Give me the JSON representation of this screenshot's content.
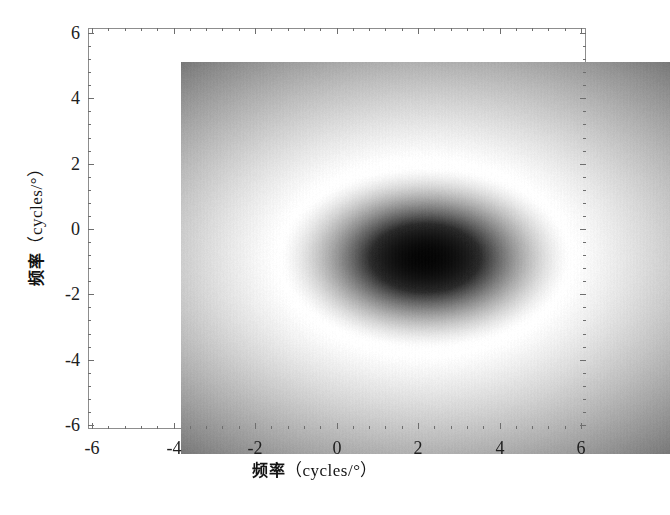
{
  "figure": {
    "title": "",
    "background_color": "#ffffff"
  },
  "axes": {
    "x": {
      "label_cjk": "频率",
      "label_unit": "（cycles/°）",
      "label_full": "频率（cycles/°）",
      "ticks": [
        "-6",
        "-4",
        "-2",
        "0",
        "2",
        "4",
        "6"
      ],
      "tick_values": [
        -6,
        -4,
        -2,
        0,
        2,
        4,
        6
      ],
      "range": [
        -6,
        6
      ],
      "minor_ticks_per_interval": 4
    },
    "y": {
      "label_cjk": "频率",
      "label_unit": "（cycles/°）",
      "label_full": "频率（cycles/°）",
      "ticks": [
        "-6",
        "-4",
        "-2",
        "0",
        "2",
        "4",
        "6"
      ],
      "tick_values": [
        -6,
        -4,
        -2,
        0,
        2,
        4,
        6
      ],
      "range": [
        -6,
        6
      ],
      "minor_ticks_per_interval": 4
    }
  },
  "chart_data": {
    "type": "heatmap",
    "title": "",
    "xlabel": "频率（cycles/°）",
    "ylabel": "频率（cycles/°）",
    "xlim": [
      -6,
      6
    ],
    "ylim": [
      -6,
      6
    ],
    "xticks": [
      -6,
      -4,
      -2,
      0,
      2,
      4,
      6
    ],
    "yticks": [
      -6,
      -4,
      -2,
      0,
      2,
      4,
      6
    ],
    "grid": false,
    "legend": "none",
    "colormap": "gray",
    "colormap_reversed": true,
    "center": [
      0.0,
      0.0
    ],
    "core": {
      "shape": "ellipse",
      "semi_axis_x": 1.35,
      "semi_axis_y": 1.05,
      "min_value": 0.02,
      "min_gray_hex": "#0a0a0a"
    },
    "bright_ring": {
      "radius_x": 3.6,
      "radius_y": 3.0,
      "max_value": 1.0,
      "max_gray_hex": "#ffffff"
    },
    "outer_falloff": {
      "corner_value": 0.47,
      "corner_gray_hex": "#787878",
      "edge_midpoint_value": 0.81,
      "edge_midpoint_gray_hex": "#cfcfcf"
    },
    "sample_points": [
      {
        "x": 0.0,
        "y": 0.0,
        "gray": 0.03
      },
      {
        "x": 0.8,
        "y": 0.0,
        "gray": 0.06
      },
      {
        "x": 0.0,
        "y": 0.7,
        "gray": 0.06
      },
      {
        "x": 1.4,
        "y": 0.0,
        "gray": 0.16
      },
      {
        "x": 0.0,
        "y": 1.1,
        "gray": 0.16
      },
      {
        "x": 2.0,
        "y": 0.0,
        "gray": 0.42
      },
      {
        "x": 0.0,
        "y": 1.6,
        "gray": 0.42
      },
      {
        "x": 2.6,
        "y": 0.0,
        "gray": 0.72
      },
      {
        "x": 0.0,
        "y": 2.1,
        "gray": 0.72
      },
      {
        "x": 3.4,
        "y": 0.0,
        "gray": 0.97
      },
      {
        "x": 0.0,
        "y": 2.8,
        "gray": 0.97
      },
      {
        "x": 4.2,
        "y": 0.0,
        "gray": 1.0
      },
      {
        "x": 0.0,
        "y": 3.5,
        "gray": 1.0
      },
      {
        "x": 6.0,
        "y": 0.0,
        "gray": 0.82
      },
      {
        "x": 0.0,
        "y": 6.0,
        "gray": 0.81
      },
      {
        "x": 6.0,
        "y": 6.0,
        "gray": 0.47
      },
      {
        "x": -6.0,
        "y": 6.0,
        "gray": 0.47
      },
      {
        "x": -6.0,
        "y": -6.0,
        "gray": 0.47
      },
      {
        "x": 6.0,
        "y": -6.0,
        "gray": 0.47
      }
    ]
  },
  "style": {
    "frame_color": "#8d8d8d",
    "tick_color": "#6e6e6e",
    "text_color": "#202020"
  }
}
